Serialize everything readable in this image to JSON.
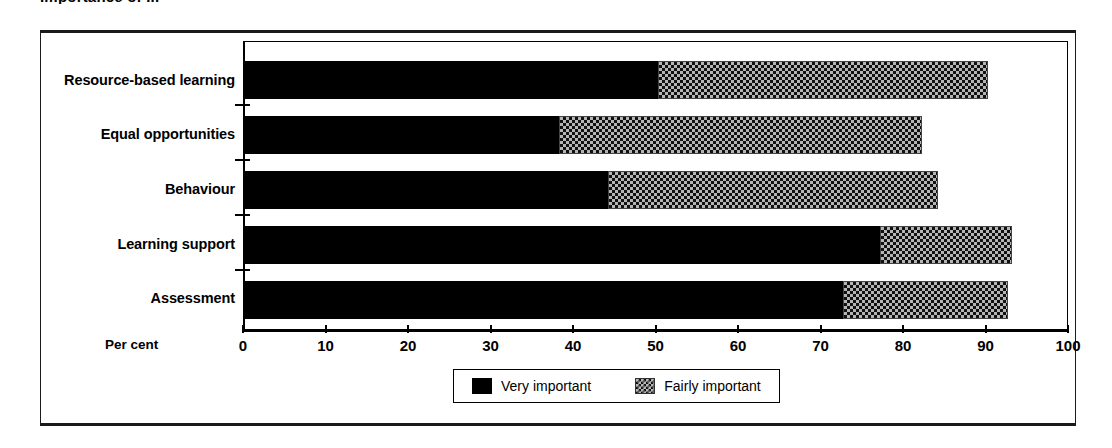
{
  "figure": {
    "title_clipped": "Importance of ..."
  },
  "axis": {
    "x_title": "Per cent",
    "x_tick_labels": [
      "0",
      "10",
      "20",
      "30",
      "40",
      "50",
      "60",
      "70",
      "80",
      "90",
      "100"
    ]
  },
  "legend": {
    "items": [
      {
        "label": "Very important",
        "swatch": "solid-black-swatch",
        "color": "#000000"
      },
      {
        "label": "Fairly important",
        "swatch": "checkered-gray-swatch",
        "color": "#b5b5b5"
      }
    ]
  },
  "chart_data": {
    "type": "bar",
    "orientation": "horizontal",
    "stacked": true,
    "title": "Importance of ...",
    "xlabel": "Per cent",
    "ylabel": "",
    "xlim": [
      0,
      100
    ],
    "xticks": [
      0,
      10,
      20,
      30,
      40,
      50,
      60,
      70,
      80,
      90,
      100
    ],
    "grid": false,
    "legend_position": "bottom",
    "categories": [
      "Resource-based learning",
      "Equal opportunities",
      "Behaviour",
      "Learning support",
      "Assessment"
    ],
    "series": [
      {
        "name": "Very important",
        "values": [
          50,
          38,
          44,
          77,
          72.5
        ]
      },
      {
        "name": "Fairly important",
        "values": [
          40,
          44,
          40,
          16,
          20
        ]
      }
    ],
    "totals": [
      90,
      82,
      84,
      93,
      92.5
    ]
  }
}
